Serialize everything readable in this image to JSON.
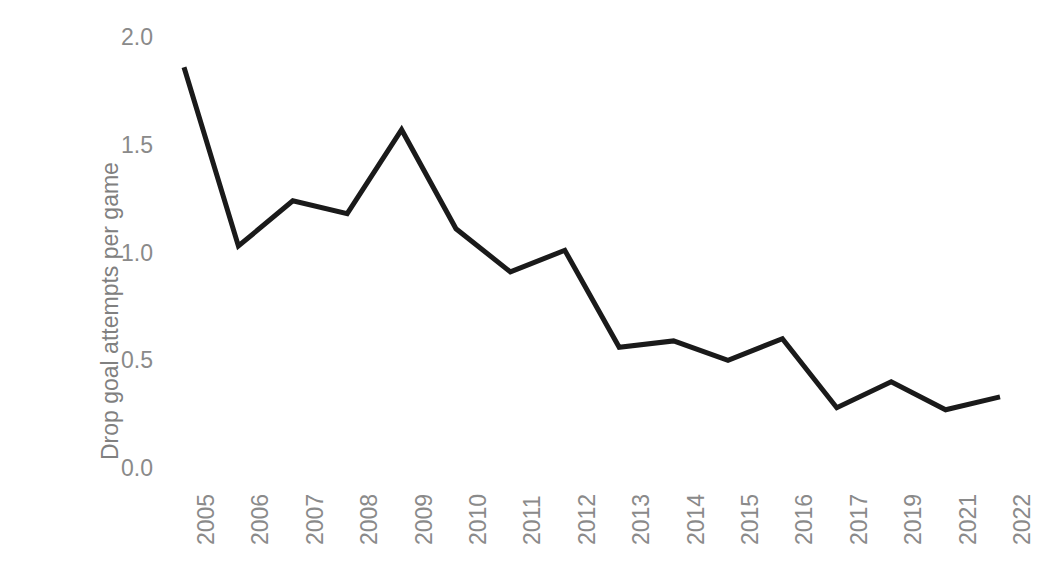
{
  "chart_data": {
    "type": "line",
    "title": "",
    "subtitle": "",
    "xlabel": "",
    "ylabel": "Drop goal attempts per game",
    "categories": [
      "2005",
      "2006",
      "2007",
      "2008",
      "2009",
      "2010",
      "2011",
      "2012",
      "2013",
      "2014",
      "2015",
      "2016",
      "2017",
      "2019",
      "2021",
      "2022"
    ],
    "values": [
      1.86,
      1.03,
      1.24,
      1.18,
      1.57,
      1.11,
      0.91,
      1.01,
      0.56,
      0.59,
      0.5,
      0.6,
      0.28,
      0.4,
      0.27,
      0.33
    ],
    "series": [
      {
        "name": "Drop goal attempts per game",
        "values": [
          1.86,
          1.03,
          1.24,
          1.18,
          1.57,
          1.11,
          0.91,
          1.01,
          0.56,
          0.59,
          0.5,
          0.6,
          0.28,
          0.4,
          0.27,
          0.33
        ]
      }
    ],
    "ylim": [
      0.0,
      2.0
    ],
    "ytick_labels": [
      "0.0",
      "0.5",
      "1.0",
      "1.5",
      "2.0"
    ],
    "ytick_values": [
      0.0,
      0.5,
      1.0,
      1.5,
      2.0
    ],
    "grid": false,
    "legend": "none",
    "axis_lines": false,
    "line_color": "#1a1a1a",
    "line_width": 5,
    "tick_label_color": "#8a8a8a",
    "axis_title_color": "#808080",
    "background_color": "#ffffff"
  }
}
